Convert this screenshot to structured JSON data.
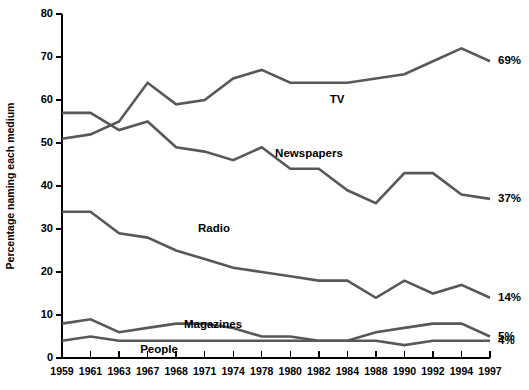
{
  "chart_data": {
    "type": "line",
    "title": "",
    "subtitle": "",
    "xlabel": "",
    "ylabel": "Percentage naming each medium",
    "ylim": [
      0,
      80
    ],
    "yticks": [
      0,
      10,
      20,
      30,
      40,
      50,
      60,
      70,
      80
    ],
    "grid": false,
    "legend_position": "inline-annotations",
    "categories": [
      "1959",
      "1961",
      "1963",
      "1967",
      "1968",
      "1971",
      "1974",
      "1978",
      "1980",
      "1982",
      "1984",
      "1988",
      "1990",
      "1992",
      "1994",
      "1997"
    ],
    "series": [
      {
        "name": "TV",
        "color": "#585858",
        "values": [
          51,
          52,
          55,
          64,
          59,
          60,
          65,
          67,
          64,
          64,
          64,
          65,
          66,
          69,
          72,
          69
        ],
        "end_label": "69%",
        "label": "TV"
      },
      {
        "name": "Newspapers",
        "color": "#585858",
        "values": [
          57,
          57,
          53,
          55,
          49,
          48,
          46,
          49,
          44,
          44,
          39,
          36,
          43,
          43,
          38,
          37
        ],
        "end_label": "37%",
        "label": "Newspapers"
      },
      {
        "name": "Radio",
        "color": "#585858",
        "values": [
          34,
          34,
          29,
          28,
          25,
          23,
          21,
          20,
          19,
          18,
          18,
          14,
          18,
          15,
          17,
          14
        ],
        "end_label": "14%",
        "label": "Radio"
      },
      {
        "name": "Magazines",
        "color": "#585858",
        "values": [
          8,
          9,
          6,
          7,
          8,
          8,
          7,
          5,
          5,
          4,
          4,
          6,
          7,
          8,
          8,
          5
        ],
        "end_label": "5%",
        "label": "Magazines"
      },
      {
        "name": "People",
        "color": "#585858",
        "values": [
          4,
          5,
          4,
          4,
          4,
          4,
          4,
          4,
          4,
          4,
          4,
          4,
          3,
          4,
          4,
          4
        ],
        "end_label": "4%",
        "label": "People"
      }
    ],
    "annotations": [
      {
        "text": "TV",
        "series": "TV",
        "x_px": 337,
        "y_px": 103
      },
      {
        "text": "Newspapers",
        "series": "Newspapers",
        "x_px": 309,
        "y_px": 157
      },
      {
        "text": "Radio",
        "series": "Radio",
        "x_px": 214,
        "y_px": 232
      },
      {
        "text": "Magazines",
        "series": "Magazines",
        "x_px": 213,
        "y_px": 328
      },
      {
        "text": "People",
        "series": "People",
        "x_px": 159,
        "y_px": 353
      }
    ]
  }
}
